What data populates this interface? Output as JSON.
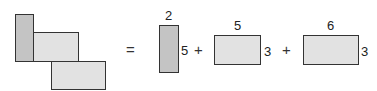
{
  "diagram": {
    "composite": {
      "rects": [
        {
          "id": "tall",
          "shade": "dark"
        },
        {
          "id": "middle",
          "shade": "light"
        },
        {
          "id": "bottom",
          "shade": "light"
        }
      ]
    },
    "equals": "=",
    "parts": [
      {
        "width_label": "2",
        "height_label": "5",
        "shade": "dark"
      },
      {
        "width_label": "5",
        "height_label": "3",
        "shade": "light"
      },
      {
        "width_label": "6",
        "height_label": "3",
        "shade": "light"
      }
    ],
    "plus_1": "+",
    "plus_2": "+",
    "colors": {
      "dark_fill": "#c4c4c4",
      "light_fill": "#e2e2e2",
      "stroke": "#333333"
    }
  }
}
